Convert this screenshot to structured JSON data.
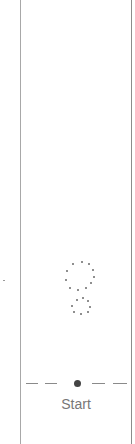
{
  "timeline": {
    "marker_label": "Start",
    "marker_color": "#444444"
  },
  "loading_indicator": {
    "icon": "loading-dots-icon"
  }
}
